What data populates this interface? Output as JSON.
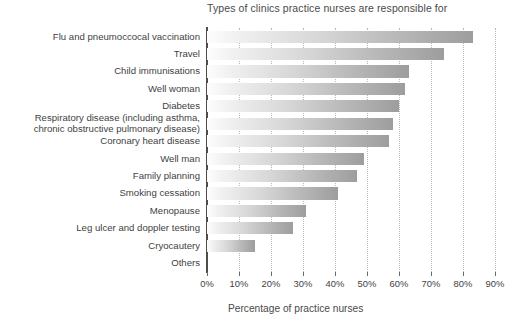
{
  "chart_data": {
    "type": "bar",
    "orientation": "horizontal",
    "title": "Types of clinics practice nurses are responsible for",
    "xlabel": "Percentage of practice nurses",
    "ylabel": "",
    "xlim": [
      0,
      90
    ],
    "grid": true,
    "legend": null,
    "categories": [
      "Flu and pneumoccocal vaccination",
      "Travel",
      "Child immunisations",
      "Well woman",
      "Diabetes",
      "Respiratory disease (including asthma,\nchronic obstructive pulmonary disease)",
      "Coronary heart disease",
      "Well man",
      "Family planning",
      "Smoking cessation",
      "Menopause",
      "Leg ulcer and doppler testing",
      "Cryocautery",
      "Others"
    ],
    "values": [
      83,
      74,
      63,
      62,
      60,
      58,
      57,
      49,
      47,
      41,
      31,
      27,
      15,
      0
    ],
    "xticks": [
      0,
      10,
      20,
      30,
      40,
      50,
      60,
      70,
      80,
      90
    ],
    "xticklabels": [
      "0%",
      "10%",
      "20%",
      "30%",
      "40%",
      "50%",
      "60%",
      "70%",
      "80%",
      "90%"
    ],
    "colors": {
      "bar_gradient_start": "#fdfdfd",
      "bar_gradient_end": "#9d9d9d",
      "axis": "#4d4d4d",
      "gridline": "#b9b9b9",
      "text": "#3f3f3f"
    }
  }
}
